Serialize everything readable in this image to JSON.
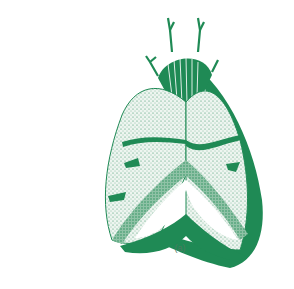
{
  "figure": {
    "caption": "(a)",
    "colors": {
      "ink": "#1f8a55",
      "paper": "#ffffff",
      "stipple": "#2f8f5f",
      "caption": "#4a7a60"
    }
  }
}
